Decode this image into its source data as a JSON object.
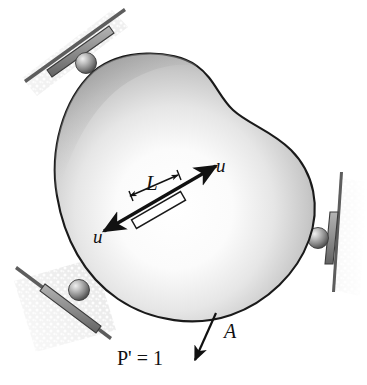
{
  "figure": {
    "name": "virtual-work-body-diagram",
    "background_color": "#ffffff",
    "width": 367,
    "height": 385
  },
  "labels": {
    "length": "L",
    "displacement_upper": "u",
    "displacement_lower": "u",
    "point": "A",
    "load": "P' = 1"
  },
  "colors": {
    "outline": "#1a1a1a",
    "body_light": "#fdfdfd",
    "body_mid": "#c9c9c9",
    "body_dark": "#8f8f8f",
    "body_edge": "#6f6f6f",
    "support_plate": "#9a9a9a",
    "support_plate_dark": "#6b6b6b",
    "hatch_gray": "#c4c4c4",
    "sphere_light": "#e8e8e8",
    "sphere_dark": "#5a5a5a",
    "bar_fill": "#ffffff",
    "arrow": "#111111"
  },
  "elements": {
    "body": "free-body-blob",
    "supports": [
      {
        "id": "support-top-left",
        "type": "roller-support"
      },
      {
        "id": "support-bottom-left",
        "type": "roller-support"
      },
      {
        "id": "support-right",
        "type": "roller-support"
      }
    ],
    "internal_member": "axial-bar-member",
    "dimension": "length-dimension-L",
    "load_arrow": "virtual-unit-load-arrow",
    "leader": "point-a-leader-line"
  }
}
